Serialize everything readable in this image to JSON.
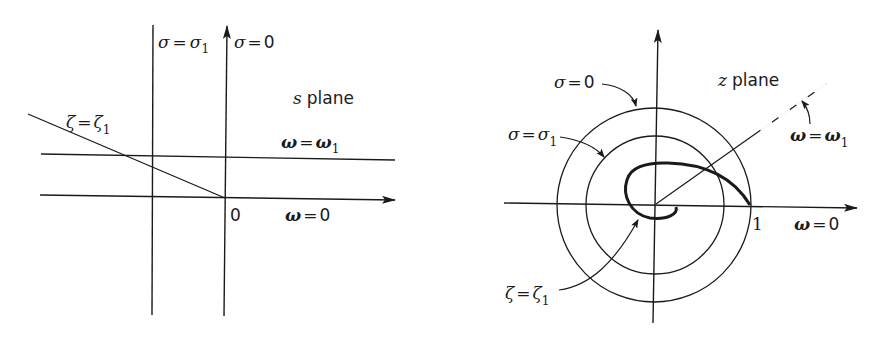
{
  "diagram": {
    "left_panel": {
      "title_var": "s",
      "title_word": "plane",
      "labels": {
        "sigma_sigma1": {
          "lhs": "σ",
          "eq": "=",
          "rhs": "σ",
          "sub": "1"
        },
        "sigma_zero": {
          "lhs": "σ",
          "eq": "=",
          "rhs": "0"
        },
        "zeta_zeta1": {
          "lhs": "ζ",
          "eq": "=",
          "rhs": "ζ",
          "sub": "1"
        },
        "omega_omega1": {
          "lhs": "ω",
          "eq": "=",
          "rhs": "ω",
          "sub": "1"
        },
        "omega_zero": {
          "lhs": "ω",
          "eq": "=",
          "rhs": "0"
        },
        "origin": "0"
      }
    },
    "right_panel": {
      "title_var": "z",
      "title_word": "plane",
      "labels": {
        "sigma_zero": {
          "lhs": "σ",
          "eq": "=",
          "rhs": "0"
        },
        "sigma_sigma1": {
          "lhs": "σ",
          "eq": "=",
          "rhs": "σ",
          "sub": "1"
        },
        "omega_omega1": {
          "lhs": "ω",
          "eq": "=",
          "rhs": "ω",
          "sub": "1"
        },
        "omega_zero": {
          "lhs": "ω",
          "eq": "=",
          "rhs": "0"
        },
        "zeta_zeta1": {
          "lhs": "ζ",
          "eq": "=",
          "rhs": "ζ",
          "sub": "1"
        },
        "unit": "1"
      }
    },
    "colors": {
      "ink": "#1a1a1a",
      "background": "#ffffff"
    }
  }
}
